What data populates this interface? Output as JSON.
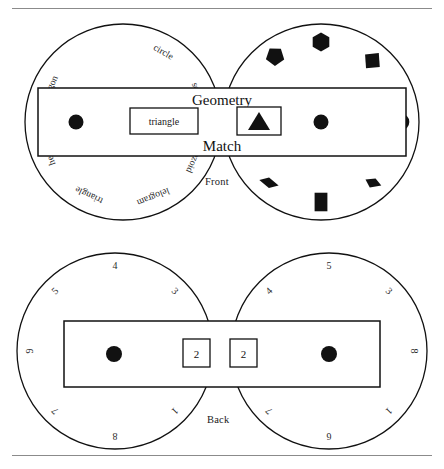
{
  "figure": {
    "captions": {
      "front": "Front",
      "back": "Back"
    },
    "title": {
      "line1": "Geometry",
      "line2": "Match"
    }
  },
  "front": {
    "left_disc": {
      "name": "word-wheel",
      "labels": [
        {
          "text": "circle",
          "angle": -60
        },
        {
          "text": "square",
          "angle": -20
        },
        {
          "text": "trapezoid",
          "angle": 25
        },
        {
          "text": "lelogram",
          "angle": 68
        },
        {
          "text": "triangle",
          "angle": 115
        },
        {
          "text": "hexagon",
          "angle": 160
        },
        {
          "text": "ntagon",
          "angle": -155
        }
      ]
    },
    "right_disc": {
      "name": "shape-wheel",
      "shapes": [
        {
          "glyph": "pentagon",
          "angle": -125
        },
        {
          "glyph": "hexagon",
          "angle": -90
        },
        {
          "glyph": "diamond",
          "angle": -50
        },
        {
          "glyph": "circle",
          "angle": 0
        },
        {
          "glyph": "trapezoid",
          "angle": 50
        },
        {
          "glyph": "square",
          "angle": 90
        },
        {
          "glyph": "parallelogram",
          "angle": 130
        }
      ]
    },
    "window_left": {
      "label": "triangle"
    },
    "window_right": {
      "glyph": "triangle"
    }
  },
  "back": {
    "left_disc": {
      "name": "left-number-wheel",
      "numbers": [
        {
          "text": "4",
          "angle": -90
        },
        {
          "text": "3",
          "angle": -45
        },
        {
          "text": "1",
          "angle": 45
        },
        {
          "text": "8",
          "angle": 90
        },
        {
          "text": "7",
          "angle": 135
        },
        {
          "text": "9",
          "angle": 180
        },
        {
          "text": "5",
          "angle": -135
        }
      ]
    },
    "right_disc": {
      "name": "right-number-wheel",
      "numbers": [
        {
          "text": "5",
          "angle": -90
        },
        {
          "text": "3",
          "angle": -45
        },
        {
          "text": "8",
          "angle": 0
        },
        {
          "text": "1",
          "angle": 45
        },
        {
          "text": "6",
          "angle": 90
        },
        {
          "text": "7",
          "angle": 135
        },
        {
          "text": "4",
          "angle": -135
        }
      ]
    },
    "window_left": {
      "value": "2"
    },
    "window_right": {
      "value": "2"
    }
  }
}
